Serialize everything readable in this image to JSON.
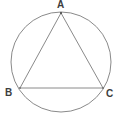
{
  "figure": {
    "background_color": "#ffffff",
    "stroke_color": "#8a8a8a",
    "label_color": "#3d3d3d",
    "stroke_width": 1,
    "circle": {
      "name": "circumscribed-circle",
      "center_x": 61,
      "center_y": 62,
      "radius": 50
    },
    "triangle": {
      "name": "inscribed-triangle",
      "vertices": [
        {
          "label": "A",
          "x": 61,
          "y": 13
        },
        {
          "label": "B",
          "x": 20,
          "y": 88
        },
        {
          "label": "C",
          "x": 103,
          "y": 88
        }
      ],
      "edges": [
        {
          "name": "side-AB",
          "from": "A",
          "to": "B"
        },
        {
          "name": "side-BC",
          "from": "B",
          "to": "C"
        },
        {
          "name": "side-CA",
          "from": "C",
          "to": "A"
        }
      ]
    },
    "labels": {
      "a": "A",
      "b": "B",
      "c": "C"
    }
  }
}
